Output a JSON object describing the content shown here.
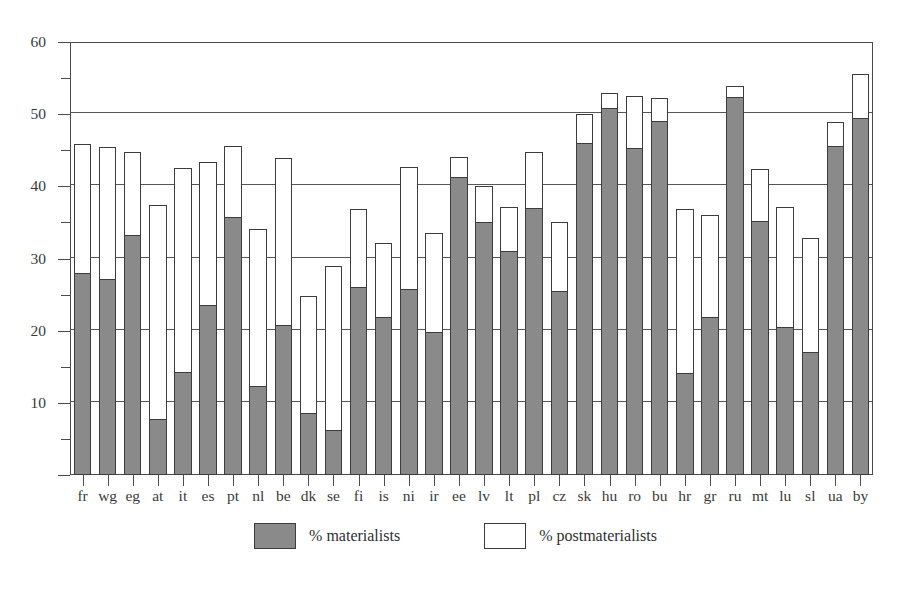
{
  "chart_data": {
    "type": "bar",
    "subtype": "stacked-vertical",
    "title": "",
    "subtitle": "",
    "xlabel": "",
    "ylabel": "",
    "ylim": [
      0,
      60
    ],
    "y_major_ticks": [
      10,
      20,
      30,
      40,
      50,
      60
    ],
    "y_minor_ticks": [
      5,
      15,
      25,
      35,
      45,
      55
    ],
    "y_tick_labels": [
      "10",
      "20",
      "30",
      "40",
      "50",
      "60"
    ],
    "grid": "horizontal-major",
    "legend_position": "bottom-center",
    "categories": [
      "fr",
      "wg",
      "eg",
      "at",
      "it",
      "es",
      "pt",
      "nl",
      "be",
      "dk",
      "se",
      "fi",
      "is",
      "ni",
      "ir",
      "ee",
      "lv",
      "lt",
      "pl",
      "cz",
      "sk",
      "hu",
      "ro",
      "bu",
      "hr",
      "gr",
      "ru",
      "mt",
      "lu",
      "sl",
      "ua",
      "by"
    ],
    "series": [
      {
        "name": "% materialists",
        "color": "#8a8a8a",
        "values": [
          28.0,
          27.2,
          33.2,
          7.8,
          14.3,
          23.5,
          35.8,
          12.3,
          20.8,
          8.6,
          6.3,
          26.1,
          21.9,
          25.8,
          19.8,
          41.3,
          35.0,
          31.0,
          37.0,
          25.5,
          46.0,
          50.8,
          45.3,
          49.0,
          14.2,
          21.9,
          52.4,
          35.2,
          20.5,
          17.0,
          45.6,
          49.5
        ]
      },
      {
        "name": "% postmaterialists",
        "color": "#ffffff",
        "values": [
          17.8,
          18.2,
          11.6,
          29.6,
          28.3,
          19.9,
          9.8,
          21.8,
          23.1,
          16.2,
          22.7,
          10.7,
          10.2,
          16.9,
          13.8,
          2.7,
          5.0,
          6.1,
          7.7,
          9.5,
          4.0,
          2.2,
          7.2,
          3.2,
          22.6,
          14.1,
          1.5,
          7.2,
          16.6,
          15.8,
          3.3,
          6.1
        ]
      }
    ],
    "totals": [
      45.8,
      45.4,
      44.8,
      37.4,
      42.6,
      43.4,
      45.6,
      34.1,
      43.9,
      24.8,
      29.0,
      36.8,
      32.1,
      42.7,
      33.6,
      44.0,
      40.0,
      37.1,
      44.7,
      35.0,
      50.0,
      53.0,
      52.5,
      52.2,
      36.8,
      36.0,
      53.9,
      42.4,
      37.1,
      32.8,
      48.9,
      55.6
    ],
    "legend": [
      {
        "label": "% materialists",
        "swatch": "#8a8a8a"
      },
      {
        "label": "% postmaterialists",
        "swatch": "#ffffff"
      }
    ]
  }
}
